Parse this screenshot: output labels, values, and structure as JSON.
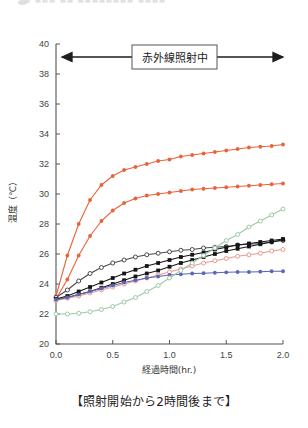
{
  "top_strip": {
    "ghost_text": "■ ■■■ ■■ ■■■■■■■■ ■■■■",
    "note": "clipped faint text row"
  },
  "caption": "【照射開始から2時間後まで】",
  "annotation": {
    "label": "赤外線照射中",
    "arrow": "double-headed"
  },
  "chart_data": {
    "type": "line",
    "title": "",
    "xlabel": "経過時間(hr.)",
    "ylabel": "温度（℃）",
    "xlim": [
      0.0,
      2.0
    ],
    "ylim": [
      20,
      40
    ],
    "xticks": [
      "0.0",
      "0.5",
      "1.0",
      "1.5",
      "2.0"
    ],
    "yticks": [
      "20",
      "22",
      "24",
      "26",
      "28",
      "30",
      "32",
      "34",
      "36",
      "38",
      "40"
    ],
    "grid": false,
    "legend_position": "none",
    "x": [
      0.0,
      0.1,
      0.2,
      0.3,
      0.4,
      0.5,
      0.6,
      0.7,
      0.8,
      0.9,
      1.0,
      1.1,
      1.2,
      1.3,
      1.4,
      1.5,
      1.6,
      1.7,
      1.8,
      1.9,
      2.0
    ],
    "series": [
      {
        "name": "赤外線照射 高温側",
        "color": "#e8633a",
        "marker": "filled-circle",
        "values": [
          23.2,
          25.9,
          28.0,
          29.6,
          30.6,
          31.2,
          31.6,
          31.8,
          32.0,
          32.2,
          32.3,
          32.5,
          32.6,
          32.7,
          32.8,
          32.9,
          33.0,
          33.1,
          33.15,
          33.2,
          33.3
        ]
      },
      {
        "name": "赤外線照射 中温側",
        "color": "#e8633a",
        "marker": "filled-circle",
        "values": [
          23.0,
          24.3,
          25.9,
          27.2,
          28.2,
          28.9,
          29.4,
          29.7,
          29.9,
          30.0,
          30.1,
          30.2,
          30.3,
          30.35,
          30.4,
          30.45,
          30.5,
          30.55,
          30.6,
          30.65,
          30.7
        ]
      },
      {
        "name": "開放円マーカー系列",
        "color": "#4a4a4a",
        "marker": "open-circle",
        "values": [
          23.1,
          23.6,
          24.2,
          24.7,
          25.1,
          25.4,
          25.6,
          25.8,
          25.95,
          26.05,
          26.15,
          26.25,
          26.3,
          26.4,
          26.45,
          26.5,
          26.6,
          26.65,
          26.7,
          26.8,
          26.9
        ]
      },
      {
        "name": "黒塗り四角系列 A",
        "color": "#151515",
        "marker": "filled-square",
        "values": [
          23.0,
          23.2,
          23.5,
          23.8,
          24.1,
          24.4,
          24.7,
          24.95,
          25.2,
          25.4,
          25.6,
          25.8,
          25.95,
          26.1,
          26.3,
          26.45,
          26.6,
          26.7,
          26.8,
          26.9,
          27.0
        ]
      },
      {
        "name": "黒塗り四角系列 B",
        "color": "#151515",
        "marker": "filled-square",
        "values": [
          22.95,
          23.1,
          23.3,
          23.5,
          23.75,
          24.0,
          24.25,
          24.5,
          24.7,
          24.9,
          25.15,
          25.4,
          25.6,
          25.8,
          26.0,
          26.2,
          26.35,
          26.5,
          26.65,
          26.8,
          26.95
        ]
      },
      {
        "name": "淡紅色系列",
        "color": "#e79a90",
        "marker": "open-circle",
        "values": [
          22.9,
          23.05,
          23.2,
          23.4,
          23.6,
          23.8,
          24.0,
          24.2,
          24.4,
          24.6,
          24.8,
          25.0,
          25.2,
          25.4,
          25.55,
          25.7,
          25.85,
          25.95,
          26.05,
          26.2,
          26.3
        ]
      },
      {
        "name": "青色系列",
        "color": "#5866b8",
        "marker": "filled-circle",
        "values": [
          22.95,
          23.1,
          23.3,
          23.5,
          23.7,
          23.9,
          24.1,
          24.25,
          24.4,
          24.5,
          24.6,
          24.65,
          24.7,
          24.72,
          24.75,
          24.78,
          24.8,
          24.8,
          24.82,
          24.85,
          24.85
        ]
      },
      {
        "name": "淡緑色系列",
        "color": "#9ec9a8",
        "marker": "open-circle",
        "values": [
          22.0,
          22.0,
          22.05,
          22.15,
          22.3,
          22.5,
          22.8,
          23.1,
          23.5,
          23.9,
          24.4,
          24.9,
          25.4,
          25.9,
          26.4,
          26.9,
          27.3,
          27.8,
          28.2,
          28.6,
          29.0
        ]
      }
    ]
  }
}
